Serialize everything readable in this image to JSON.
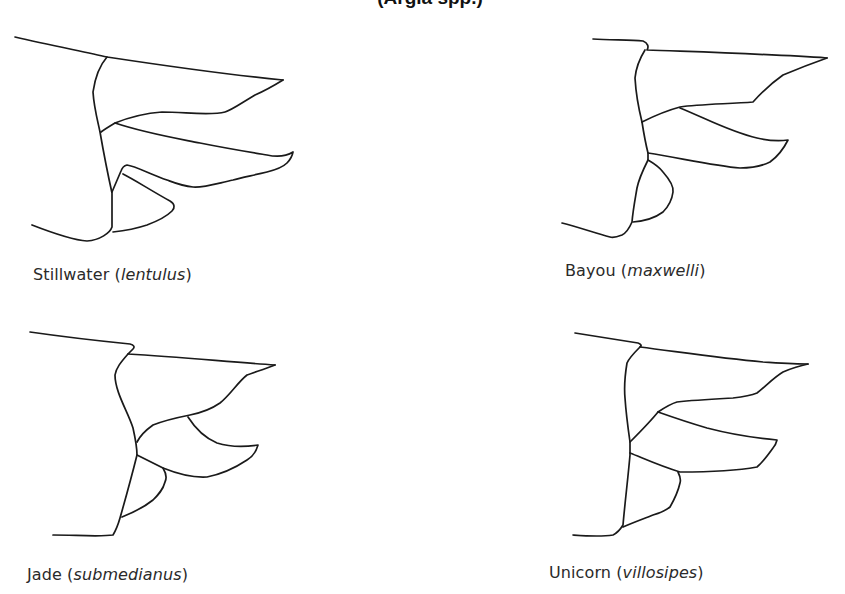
{
  "figure": {
    "title_fragment": "(Argia spp.)",
    "line_color": "#1a1a1a",
    "background_color": "#ffffff"
  },
  "panels": [
    {
      "id": "stillwater",
      "common_name": "Stillwater",
      "scientific_name": "lentulus",
      "open_paren": " (",
      "close_paren": ")"
    },
    {
      "id": "bayou",
      "common_name": "Bayou",
      "scientific_name": "maxwelli",
      "open_paren": " (",
      "close_paren": ")"
    },
    {
      "id": "jade",
      "common_name": "Jade",
      "scientific_name": "submedianus",
      "open_paren": " (",
      "close_paren": ")"
    },
    {
      "id": "unicorn",
      "common_name": "Unicorn",
      "scientific_name": "villosipes",
      "open_paren": " (",
      "close_paren": ")"
    }
  ]
}
